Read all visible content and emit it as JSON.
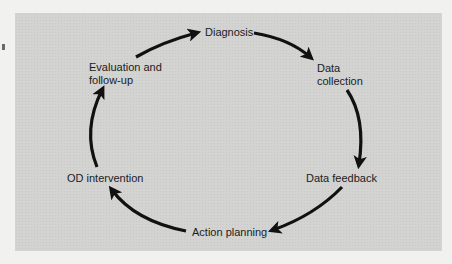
{
  "diagram": {
    "type": "cycle",
    "colors": {
      "panel": "#d3d3d2",
      "background": "#f1f1f0",
      "arrow": "#111111",
      "text": "#1c1c1c"
    },
    "nodes": [
      {
        "id": "diagnosis",
        "lines": [
          "Diagnosis"
        ]
      },
      {
        "id": "data-collection",
        "lines": [
          "Data",
          "collection"
        ]
      },
      {
        "id": "data-feedback",
        "lines": [
          "Data feedback"
        ]
      },
      {
        "id": "action-planning",
        "lines": [
          "Action planning"
        ]
      },
      {
        "id": "od-intervention",
        "lines": [
          "OD intervention"
        ]
      },
      {
        "id": "evaluation",
        "lines": [
          "Evaluation and",
          "follow-up"
        ]
      }
    ],
    "edges": [
      {
        "from": "diagnosis",
        "to": "data-collection"
      },
      {
        "from": "data-collection",
        "to": "data-feedback"
      },
      {
        "from": "data-feedback",
        "to": "action-planning"
      },
      {
        "from": "action-planning",
        "to": "od-intervention"
      },
      {
        "from": "od-intervention",
        "to": "evaluation"
      },
      {
        "from": "evaluation",
        "to": "diagnosis"
      }
    ],
    "direction": "clockwise"
  }
}
